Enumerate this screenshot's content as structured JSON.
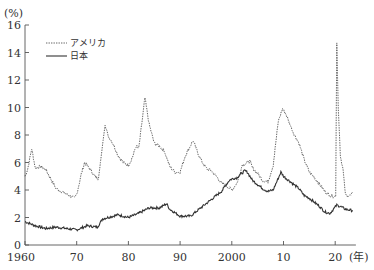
{
  "chart_data": {
    "type": "line",
    "title": "",
    "xlabel": "(年)",
    "ylabel": "(%)",
    "xlim": [
      1960,
      2024
    ],
    "ylim": [
      0,
      16
    ],
    "grid": false,
    "legend_position": "upper-left",
    "x_ticks": [
      1960,
      1970,
      1980,
      1990,
      2000,
      2010,
      2020
    ],
    "x_tick_labels": [
      "1960",
      "70",
      "80",
      "90",
      "2000",
      "10",
      "20"
    ],
    "y_ticks": [
      0,
      2,
      4,
      6,
      8,
      10,
      12,
      14,
      16
    ],
    "y_tick_labels": [
      "0",
      "2",
      "4",
      "6",
      "8",
      "10",
      "12",
      "14",
      "16"
    ],
    "series": [
      {
        "name": "アメリカ",
        "style": "dotted",
        "x": [
          1960,
          1960.5,
          1961.3,
          1962,
          1963,
          1964,
          1965,
          1966,
          1967,
          1968,
          1969.6,
          1970,
          1970.8,
          1971.5,
          1972,
          1972.8,
          1973.5,
          1974.2,
          1975.5,
          1976,
          1977,
          1978,
          1979,
          1980,
          1980.8,
          1981.5,
          1982,
          1983.2,
          1984,
          1985,
          1986,
          1987,
          1988,
          1989,
          1990,
          1991,
          1992.5,
          1993,
          1994,
          1995,
          1996,
          1997,
          1998,
          1999,
          2000,
          2001,
          2002,
          2003.5,
          2004,
          2005,
          2006,
          2007,
          2008,
          2009,
          2009.8,
          2010.5,
          2011,
          2012,
          2013,
          2014,
          2015,
          2016,
          2017,
          2018,
          2019,
          2020.1,
          2020.3,
          2020.6,
          2021,
          2021.5,
          2022,
          2022.5,
          2023,
          2023.4
        ],
        "values": [
          5.0,
          5.5,
          7.0,
          5.6,
          5.7,
          5.5,
          4.8,
          4.1,
          3.9,
          3.7,
          3.4,
          3.7,
          5.0,
          6.0,
          5.8,
          5.4,
          5.0,
          4.8,
          8.8,
          8.0,
          7.4,
          6.5,
          6.0,
          5.8,
          6.4,
          7.2,
          7.0,
          10.7,
          8.8,
          7.4,
          7.2,
          6.8,
          5.7,
          5.3,
          5.3,
          6.5,
          7.6,
          7.1,
          6.2,
          5.6,
          5.4,
          5.0,
          4.5,
          4.3,
          4.0,
          4.5,
          5.8,
          6.1,
          5.6,
          5.2,
          4.7,
          4.6,
          5.8,
          9.0,
          9.9,
          9.5,
          9.0,
          8.1,
          7.4,
          6.2,
          5.3,
          4.9,
          4.4,
          3.9,
          3.6,
          3.5,
          14.7,
          10.0,
          6.5,
          5.5,
          3.6,
          3.6,
          3.6,
          3.8
        ]
      },
      {
        "name": "日本",
        "style": "solid",
        "x": [
          1960,
          1962,
          1964,
          1966,
          1968,
          1970,
          1972,
          1974,
          1975,
          1976,
          1978,
          1980,
          1982,
          1984,
          1986,
          1987.4,
          1988,
          1990,
          1992,
          1994,
          1996,
          1998,
          1999.5,
          2000,
          2001,
          2002.5,
          2003,
          2004,
          2005,
          2006,
          2007,
          2008,
          2009.5,
          2010,
          2011,
          2012,
          2013,
          2014,
          2015,
          2016,
          2017,
          2018,
          2019,
          2020.3,
          2021,
          2022,
          2023.4
        ],
        "values": [
          1.7,
          1.4,
          1.2,
          1.3,
          1.2,
          1.1,
          1.4,
          1.3,
          1.9,
          2.0,
          2.2,
          2.0,
          2.3,
          2.7,
          2.7,
          3.0,
          2.6,
          2.1,
          2.1,
          2.7,
          3.3,
          3.9,
          4.7,
          4.8,
          4.9,
          5.4,
          5.3,
          4.7,
          4.4,
          4.1,
          3.9,
          4.0,
          5.3,
          5.0,
          4.7,
          4.4,
          4.1,
          3.6,
          3.4,
          3.1,
          2.8,
          2.4,
          2.3,
          2.9,
          2.8,
          2.6,
          2.5
        ]
      }
    ]
  },
  "legend": {
    "us_label": "アメリカ",
    "jp_label": "日本"
  },
  "axes": {
    "y_unit": "(%)",
    "x_unit": "(年)"
  }
}
